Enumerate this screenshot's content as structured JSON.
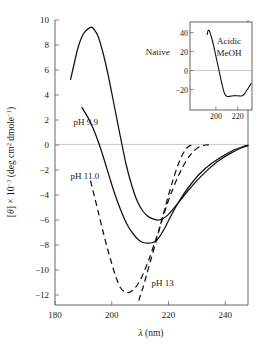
{
  "chart_data": {
    "type": "line",
    "title": "",
    "xlabel": "λ (nm)",
    "ylabel": "[θ] × 10⁻³ (deg cm² dmole⁻¹)",
    "xlim": [
      180,
      248
    ],
    "ylim": [
      -12.8,
      10
    ],
    "xticks": [
      180,
      200,
      220,
      240
    ],
    "yticks": [
      10,
      8,
      6,
      4,
      2,
      0,
      -2,
      -4,
      -6,
      -8,
      -10,
      -12
    ],
    "xtick_labels": [
      "180",
      "200",
      "220",
      "240"
    ],
    "ytick_labels": [
      "10",
      "8",
      "6",
      "4",
      "2",
      "0",
      "−2",
      "−4",
      "−6",
      "−8",
      "−10",
      "−12"
    ],
    "grid": false,
    "zero_line": true,
    "legend_position": "inline-annotations",
    "series": [
      {
        "name": "Native",
        "style": "solid",
        "label": "Native",
        "label_x": 212,
        "label_y": 7.2,
        "x": [
          185.5,
          188,
          190,
          192,
          193.2,
          195,
          197,
          199,
          201,
          203,
          205,
          207,
          209,
          211,
          213,
          215,
          216.5,
          218,
          220,
          223,
          226,
          230,
          234,
          238,
          242,
          246,
          248
        ],
        "y": [
          5.25,
          7.7,
          8.9,
          9.35,
          9.4,
          8.8,
          7.3,
          5.3,
          3.0,
          0.7,
          -1.5,
          -3.2,
          -4.5,
          -5.3,
          -5.75,
          -5.95,
          -6.0,
          -5.9,
          -5.55,
          -4.75,
          -3.9,
          -2.85,
          -1.95,
          -1.2,
          -0.65,
          -0.2,
          -0.05
        ]
      },
      {
        "name": "pH 9.9",
        "style": "solid",
        "label": "pH 9.9",
        "label_x": 186.5,
        "label_y": 1.6,
        "x": [
          189.5,
          191.5,
          193.5,
          195.5,
          197.5,
          199.5,
          201.5,
          203.5,
          205.5,
          207.5,
          209.5,
          211,
          213,
          214.5,
          216,
          217.5,
          219,
          221,
          224,
          227,
          231,
          235,
          239,
          243,
          246.5,
          248
        ],
        "y": [
          3.0,
          2.25,
          1.3,
          0.1,
          -1.3,
          -2.8,
          -4.2,
          -5.4,
          -6.4,
          -7.1,
          -7.6,
          -7.8,
          -7.85,
          -7.8,
          -7.6,
          -7.1,
          -6.5,
          -5.6,
          -4.4,
          -3.4,
          -2.3,
          -1.5,
          -0.9,
          -0.4,
          -0.1,
          -0.02
        ]
      },
      {
        "name": "pH 11.0",
        "style": "dashed",
        "label": "pH 11.0",
        "label_x": 185.5,
        "label_y": -2.7,
        "x": [
          192.5,
          194,
          195.5,
          197,
          198.5,
          200,
          201.5,
          203,
          204.5,
          206,
          207.5,
          209,
          210.5,
          212,
          213.5,
          215,
          216.5,
          218,
          219.5,
          221,
          223,
          225,
          227,
          229,
          231,
          233,
          235
        ],
        "y": [
          -2.85,
          -4.2,
          -5.6,
          -7.0,
          -8.3,
          -9.5,
          -10.6,
          -11.4,
          -11.75,
          -11.8,
          -11.6,
          -11.2,
          -10.6,
          -9.8,
          -8.9,
          -7.9,
          -6.9,
          -5.8,
          -4.75,
          -3.8,
          -2.7,
          -1.75,
          -1.0,
          -0.45,
          -0.12,
          0.0,
          0.0
        ]
      },
      {
        "name": "pH 13",
        "style": "dashed",
        "label": "pH 13",
        "label_x": 214,
        "label_y": -11.3,
        "x": [
          209.5,
          211,
          212.5,
          214,
          215.5,
          217,
          218.5,
          220,
          221.5,
          223,
          224.5,
          226,
          227.5,
          229
        ],
        "y": [
          -12.45,
          -11.4,
          -10.2,
          -9.0,
          -7.8,
          -6.5,
          -5.25,
          -4.0,
          -2.85,
          -1.8,
          -0.95,
          -0.35,
          -0.05,
          0.0
        ]
      }
    ],
    "inset": {
      "title": "Acidic MeOH",
      "title_line1": "Acidic",
      "title_line2": "MeOH",
      "xlim": [
        191,
        232
      ],
      "ylim": [
        -32,
        48
      ],
      "xticks": [
        200,
        220
      ],
      "yticks": [
        40,
        20,
        0,
        -20
      ],
      "xtick_labels": [
        "200",
        "220"
      ],
      "ytick_labels": [
        "40",
        "20",
        "0",
        "−20"
      ],
      "zero_line": true,
      "series": [
        {
          "name": "Acidic MeOH",
          "style": "solid",
          "x": [
            192,
            193,
            194,
            195,
            196.5,
            198,
            199.5,
            201,
            202.5,
            204,
            205.5,
            207,
            208.5,
            210,
            212,
            214,
            216,
            218,
            220,
            222,
            224,
            226,
            228,
            230,
            232
          ],
          "y": [
            38,
            42.5,
            42,
            39,
            33,
            26,
            18,
            10,
            2,
            -6,
            -14,
            -21,
            -25.5,
            -27,
            -27.2,
            -26.8,
            -26.4,
            -26.3,
            -26.5,
            -26.8,
            -26.4,
            -24.5,
            -21,
            -17.5,
            -13.5
          ]
        }
      ]
    }
  },
  "colors": {
    "curve": "#111111",
    "frame": "#555555",
    "zero_line": "#b9b9b9",
    "background": "#ffffff"
  }
}
